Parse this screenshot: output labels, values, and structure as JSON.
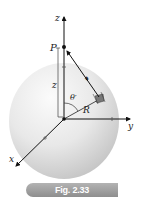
{
  "figure": {
    "caption": "Fig. 2.33",
    "labels": {
      "z_axis": "z",
      "y_axis": "y",
      "x_axis": "x",
      "point": "P",
      "z_prime": "z",
      "theta": "θ′",
      "radius": "R",
      "separation": "𝓻"
    },
    "colors": {
      "sphere_light": "#f4f4f4",
      "sphere_dark": "#c8c8c8",
      "axis": "#111111",
      "caption_bg": "#9e9e9e",
      "caption_text": "#ffffff"
    }
  }
}
